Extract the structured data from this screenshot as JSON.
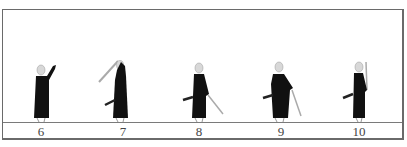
{
  "figure": {
    "frames": [
      {
        "label": "6",
        "pose": "raising-hand"
      },
      {
        "label": "7",
        "pose": "sword-overhead"
      },
      {
        "label": "8",
        "pose": "sword-low-right"
      },
      {
        "label": "9",
        "pose": "sword-down-right"
      },
      {
        "label": "10",
        "pose": "sword-vertical"
      }
    ]
  }
}
